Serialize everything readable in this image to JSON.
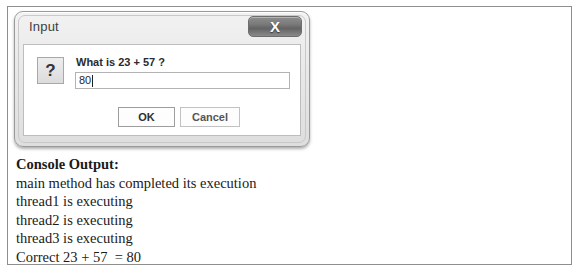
{
  "dialog": {
    "title": "Input",
    "close_label": "X",
    "close_icon": "close-icon",
    "icon": "question-mark-icon",
    "icon_glyph": "?",
    "prompt": "What is 23 + 57 ?",
    "input_value": "80",
    "input_placeholder": "",
    "ok_label": "OK",
    "cancel_label": "Cancel"
  },
  "console": {
    "heading": "Console Output:",
    "lines": [
      "main method has completed its execution",
      "thread1 is executing",
      "thread2 is executing",
      "thread3 is executing",
      "Correct 23 + 57  = 80"
    ]
  },
  "colors": {
    "frame_border": "#8e8e8e",
    "dialog_border": "#9a9a9a",
    "titlebar_gradient_top": "#f2f2f2",
    "close_button_dark": "#636363",
    "text": "#1a1a1a"
  }
}
